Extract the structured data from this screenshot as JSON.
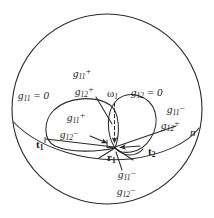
{
  "figure": {
    "background_color": "#ffffff",
    "stroke_color": "#2b2b2b",
    "canvas": {
      "width": 214,
      "height": 218
    }
  },
  "labels": {
    "g11_zero": {
      "base": "g",
      "sub": "11",
      "sup": "",
      "tail": " = 0",
      "x": 18,
      "y": 96
    },
    "g12_zero": {
      "base": "g",
      "sub": "12",
      "sup": "",
      "tail": " = 0",
      "x": 131,
      "y": 93
    },
    "g11_plus_outer": {
      "base": "g",
      "sub": "11",
      "sup": "+",
      "tail": "",
      "x": 73,
      "y": 74
    },
    "g12_plus_outer": {
      "base": "g",
      "sub": "12",
      "sup": "+",
      "tail": "",
      "x": 75,
      "y": 92
    },
    "g11_plus_inner": {
      "base": "g",
      "sub": "11",
      "sup": "+",
      "tail": "",
      "x": 67,
      "y": 118
    },
    "g12_minus_inner": {
      "base": "g",
      "sub": "12",
      "sup": "–",
      "tail": "",
      "x": 64,
      "y": 135
    },
    "g11_minus_right": {
      "base": "g",
      "sub": "11",
      "sup": "–",
      "tail": "",
      "x": 167,
      "y": 110
    },
    "g12_plus_right": {
      "base": "g",
      "sub": "12",
      "sup": "+",
      "tail": "",
      "x": 161,
      "y": 126
    },
    "g11_minus_bottom": {
      "base": "g",
      "sub": "11",
      "sup": "–",
      "tail": "",
      "x": 118,
      "y": 175
    },
    "g12_minus_bottom": {
      "base": "g",
      "sub": "12",
      "sup": "–",
      "tail": "",
      "x": 117,
      "y": 192
    },
    "omega1": {
      "base": "ω",
      "sub": "1",
      "x": 108,
      "y": 95
    },
    "t1": {
      "base": "t",
      "sub": "1",
      "x": 36,
      "y": 145
    },
    "t2": {
      "base": "t",
      "sub": "2",
      "x": 148,
      "y": 152
    },
    "r1": {
      "base": "r",
      "sub": "1",
      "x": 107,
      "y": 158
    },
    "n": {
      "base": "n",
      "x": 190,
      "y": 133
    }
  },
  "geometry": {
    "sphere": {
      "cx": 107,
      "cy": 109,
      "r": 95
    },
    "equator_note": "great-circle arc seen nearly edge-on, tilted",
    "left_loop": {
      "cx": 83,
      "cy": 125,
      "rx": 38,
      "ry": 26
    },
    "right_loop": {
      "cx": 128,
      "cy": 123,
      "rx": 26,
      "ry": 28
    },
    "contact_point": {
      "x": 115,
      "y": 148
    },
    "tangent_point_1": {
      "x": 45,
      "y": 141
    },
    "tangent_point_2": {
      "x": 143,
      "y": 146
    },
    "normal_arrow": {
      "x1": 115,
      "y1": 104,
      "x2": 115,
      "y2": 145,
      "style": "dashed"
    }
  }
}
